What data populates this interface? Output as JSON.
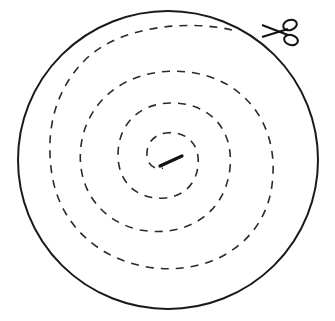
{
  "diagram": {
    "title": "Spiral cutting pattern",
    "outer_circle": {
      "cx": 168,
      "cy": 160,
      "r": 150,
      "stroke": "#1a1a1a"
    },
    "spiral": {
      "style": "dashed",
      "stroke": "#2a2a2a",
      "turns": 4
    },
    "center_mark": {
      "style": "solid bold line"
    },
    "scissors_icon": {
      "position": "top-right",
      "meaning": "cut here"
    }
  }
}
